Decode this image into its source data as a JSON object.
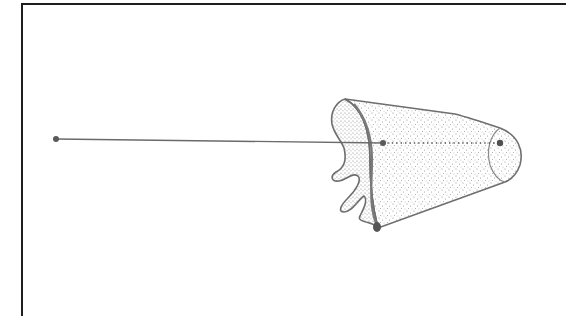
{
  "diagram": {
    "description": "Point-source line to a stippled frustum with irregular (wavy) cross-section and dotted central axis",
    "labels": [],
    "colors": {
      "background": "#ffffff",
      "frame": "#1e1e1e",
      "stroke": "#6e6e6e",
      "point": "#5a5a5a",
      "stipple": "#8a8a8a"
    },
    "points": {
      "source": {
        "x": 56,
        "y": 139
      },
      "near_center": {
        "x": 383,
        "y": 143
      },
      "far_center": {
        "x": 500,
        "y": 143
      },
      "base_point": {
        "x": 377,
        "y": 227
      }
    },
    "segments": [
      {
        "name": "source-line",
        "style": "solid",
        "from": "source",
        "to": "near_center"
      },
      {
        "name": "axis",
        "style": "dotted",
        "from": "near_center",
        "to": "far_center"
      }
    ]
  }
}
